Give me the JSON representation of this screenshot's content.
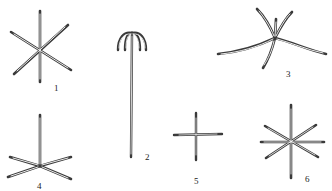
{
  "figure": {
    "ink_color": "#3a3a3a",
    "background": "#ffffff",
    "items": [
      {
        "label": "1",
        "type": "six-rayed star",
        "center": [
          40,
          48
        ],
        "arms": [
          [
            40,
            11
          ],
          [
            40,
            82
          ],
          [
            11,
            32
          ],
          [
            71,
            70
          ],
          [
            68,
            25
          ],
          [
            14,
            74
          ]
        ],
        "label_pos": [
          55,
          89
        ]
      },
      {
        "label": "2",
        "type": "long stem with umbrella-like recurved hooks",
        "stem": [
          [
            132,
            33
          ],
          [
            131,
            157
          ]
        ],
        "label_pos": [
          146,
          159
        ]
      },
      {
        "label": "3",
        "type": "irregular five-rayed with curved long arms",
        "center": [
          275,
          38
        ],
        "label_pos": [
          287,
          76
        ]
      },
      {
        "label": "4",
        "type": "four rays plus vertical ray (tripod-like)",
        "center": [
          40,
          166
        ],
        "arms": [
          [
            40,
            115
          ],
          [
            10,
            157
          ],
          [
            71,
            157
          ],
          [
            8,
            177
          ],
          [
            71,
            179
          ]
        ],
        "label_pos": [
          37,
          189
        ]
      },
      {
        "label": "5",
        "type": "cross / four-rayed",
        "center": [
          196,
          135
        ],
        "arms": [
          [
            196,
            113
          ],
          [
            196,
            160
          ],
          [
            174,
            135
          ],
          [
            222,
            134
          ]
        ],
        "label_pos": [
          194,
          184
        ]
      },
      {
        "label": "6",
        "type": "eight-rayed star",
        "center": [
          291,
          141
        ],
        "arms": [
          [
            291,
            105
          ],
          [
            291,
            178
          ],
          [
            261,
            142
          ],
          [
            324,
            142
          ],
          [
            265,
            126
          ],
          [
            318,
            157
          ],
          [
            316,
            125
          ],
          [
            266,
            158
          ]
        ],
        "label_pos": [
          305,
          181
        ]
      }
    ]
  }
}
